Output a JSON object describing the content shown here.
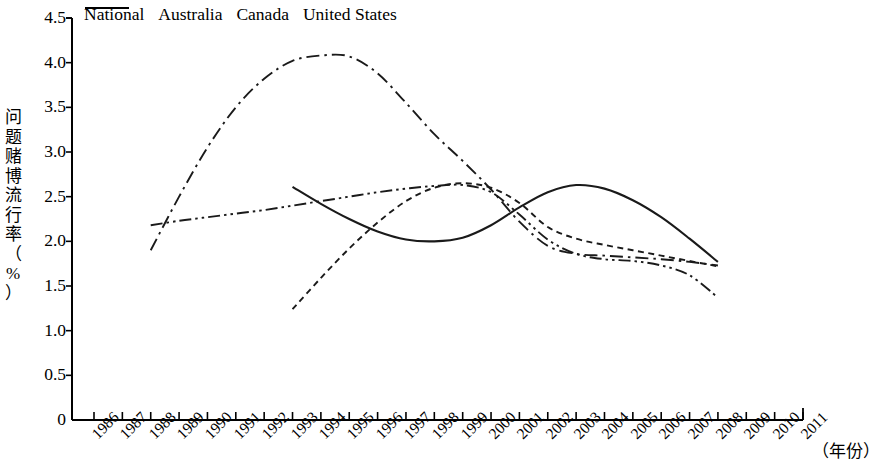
{
  "chart_data": {
    "type": "line",
    "title": "",
    "xlabel": "（年份）",
    "ylabel": "问题赌博流行率（%）",
    "ylim": [
      0,
      4.5
    ],
    "ytick_labels": [
      "0",
      "0.5",
      "1.0",
      "1.5",
      "2.0",
      "2.5",
      "3.0",
      "3.5",
      "4.0",
      "4.5"
    ],
    "ytick_values": [
      0,
      0.5,
      1.0,
      1.5,
      2.0,
      2.5,
      3.0,
      3.5,
      4.0,
      4.5
    ],
    "xlim": [
      1986,
      2011
    ],
    "categories": [
      1986,
      1987,
      1988,
      1989,
      1990,
      1991,
      1992,
      1993,
      1994,
      1995,
      1996,
      1997,
      1998,
      1999,
      2000,
      2001,
      2002,
      2003,
      2004,
      2005,
      2006,
      2007,
      2008,
      2009,
      2010,
      2011
    ],
    "xtick_labels": [
      "1986",
      "1987",
      "1988",
      "1989",
      "1990",
      "1991",
      "1992",
      "1993",
      "1994",
      "1995",
      "1996",
      "1997",
      "1998",
      "1999",
      "2000",
      "2001",
      "2002",
      "2003",
      "2004",
      "2005",
      "2006",
      "2007",
      "2008",
      "2009",
      "2010",
      "2011"
    ],
    "grid": false,
    "legend_position": "top",
    "series": [
      {
        "name": "National",
        "style": "solid",
        "x": [
          1993,
          1994,
          1995,
          1996,
          1997,
          1998,
          1999,
          2000,
          2001,
          2002,
          2003,
          2004,
          2005,
          2006,
          2007,
          2008
        ],
        "values": [
          2.61,
          2.42,
          2.25,
          2.11,
          2.02,
          2.0,
          2.04,
          2.18,
          2.38,
          2.55,
          2.63,
          2.59,
          2.46,
          2.27,
          2.03,
          1.77
        ]
      },
      {
        "name": "Australia",
        "style": "dashed",
        "x": [
          1993,
          1994,
          1995,
          1996,
          1997,
          1998,
          1999,
          2000,
          2001,
          2002,
          2003,
          2004,
          2005,
          2006,
          2007,
          2008
        ],
        "values": [
          1.24,
          1.59,
          1.92,
          2.21,
          2.45,
          2.6,
          2.65,
          2.6,
          2.43,
          2.16,
          2.03,
          1.96,
          1.9,
          1.84,
          1.78,
          1.72
        ]
      },
      {
        "name": "Canada",
        "style": "dash-dot",
        "x": [
          1988,
          1989,
          1990,
          1991,
          1992,
          1993,
          1994,
          1995,
          1996,
          1997,
          1998,
          1999,
          2000,
          2001,
          2002,
          2003,
          2004,
          2005,
          2006,
          2007,
          2008
        ],
        "values": [
          1.9,
          2.5,
          3.05,
          3.5,
          3.82,
          4.02,
          4.08,
          4.07,
          3.88,
          3.55,
          3.2,
          2.9,
          2.58,
          2.22,
          1.95,
          1.86,
          1.84,
          1.82,
          1.8,
          1.77,
          1.73
        ]
      },
      {
        "name": "United States",
        "style": "dash-dot-dot",
        "x": [
          1988,
          1989,
          1990,
          1991,
          1992,
          1993,
          1994,
          1995,
          1996,
          1997,
          1998,
          1999,
          2000,
          2001,
          2002,
          2003,
          2004,
          2005,
          2006,
          2007,
          2008
        ],
        "values": [
          2.18,
          2.23,
          2.27,
          2.31,
          2.35,
          2.4,
          2.45,
          2.5,
          2.55,
          2.59,
          2.62,
          2.63,
          2.55,
          2.3,
          2.02,
          1.86,
          1.8,
          1.78,
          1.73,
          1.62,
          1.37
        ]
      }
    ]
  },
  "legend": {
    "items": [
      {
        "label": "National"
      },
      {
        "label": "Australia"
      },
      {
        "label": "Canada"
      },
      {
        "label": "United States"
      }
    ]
  },
  "axes": {
    "y_label_chars": [
      "问",
      "题",
      "赌",
      "博",
      "流",
      "行",
      "率",
      "（",
      "%",
      "）"
    ],
    "x_unit": "（年份）"
  }
}
